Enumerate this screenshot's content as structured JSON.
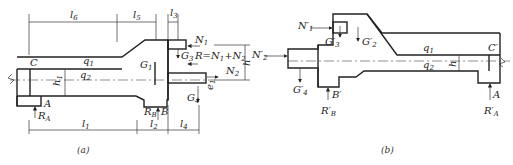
{
  "figure_a": {
    "caption": "(a)",
    "dimensions": [
      "l6",
      "l5",
      "l3",
      "l1",
      "l2",
      "l4",
      "h",
      "h1",
      "e1"
    ],
    "labels": {
      "l6": "l",
      "l6_sub": "6",
      "l5": "l",
      "l5_sub": "5",
      "l3": "l",
      "l3_sub": "3",
      "l1": "l",
      "l1_sub": "1",
      "l2": "l",
      "l2_sub": "2",
      "l4": "l",
      "l4_sub": "4",
      "h": "h",
      "h1": "h",
      "h1_sub": "1",
      "e1": "e",
      "e1_sub": "1",
      "C": "C",
      "A": "A",
      "B": "B",
      "q1": "q",
      "q1_sub": "1",
      "q2": "q",
      "q2_sub": "2",
      "G1": "G",
      "G1_sub": "1",
      "G3": "G",
      "G3_sub": "3",
      "G4": "G",
      "G4_sub": "4",
      "N1": "N",
      "N1_sub": "1",
      "N2": "N",
      "N2_sub": "2",
      "RA": "R",
      "RA_sub": "A",
      "RB": "R",
      "RB_sub": "B",
      "R_eq": "R=N",
      "R_eq_sub1": "1",
      "R_eq_plus": "+N",
      "R_eq_sub2": "2"
    }
  },
  "figure_b": {
    "caption": "(b)",
    "labels": {
      "N1p": "N′",
      "N1p_sub": "1",
      "N2p": "N′",
      "N2p_sub": "2",
      "G2p": "G′",
      "G2p_sub": "2",
      "G3p": "G′",
      "G3p_sub": "3",
      "G4p": "G′",
      "G4p_sub": "4",
      "Bp": "B′",
      "RBp": "R′",
      "RBp_sub": "B",
      "Cp": "C′",
      "Ap": "A",
      "RAp": "R′",
      "RAp_sub": "A",
      "q1": "q",
      "q1_sub": "1",
      "q2": "q",
      "q2_sub": "2",
      "h": "h"
    }
  }
}
